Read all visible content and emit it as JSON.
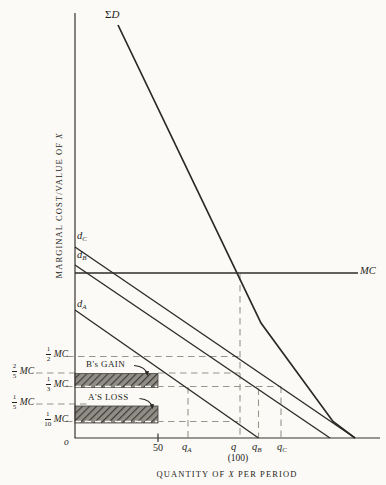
{
  "titles": {
    "y_pre": "MARGINAL COST/VALUE OF ",
    "y_x": "X",
    "x_pre": "QUANTITY OF ",
    "x_x": "X",
    "x_post": " PER PERIOD"
  },
  "axes": {
    "origin": "o"
  },
  "curves": {
    "sigma_d": {
      "sigma": "Σ",
      "name": "D"
    },
    "d_c": {
      "base": "d",
      "sub": "C"
    },
    "d_b": {
      "base": "d",
      "sub": "B"
    },
    "d_a": {
      "base": "d",
      "sub": "A"
    },
    "mc": {
      "label": "MC"
    }
  },
  "y_labels": [
    {
      "num": "1",
      "den": "2",
      "unit": "MC"
    },
    {
      "num": "2",
      "den": "5",
      "unit": "MC"
    },
    {
      "num": "1",
      "den": "3",
      "unit": "MC"
    },
    {
      "num": "1",
      "den": "5",
      "unit": "MC"
    },
    {
      "num": "1",
      "den": "10",
      "unit": "MC"
    }
  ],
  "x_labels": {
    "fifty": "50",
    "q_a": {
      "base": "q",
      "sub": "A"
    },
    "q": {
      "base": "q",
      "sub": ""
    },
    "q_paren": "(100)",
    "q_b": {
      "base": "q",
      "sub": "B"
    },
    "q_c": {
      "base": "q",
      "sub": "C"
    }
  },
  "annotations": {
    "b_gain": "B's GAIN",
    "a_loss": "A'S LOSS"
  },
  "colors": {
    "line": "#2e2c29",
    "dashed": "#98948e",
    "dashed_on_fill": "#f7f6f2",
    "hatch_dark": "#403d39",
    "hatch_light": "#918e88",
    "background": "#fbfaf6",
    "text": "#1f1d1a"
  },
  "chart_data": {
    "type": "line",
    "title": "",
    "xlabel": "QUANTITY OF X PER PERIOD",
    "ylabel": "MARGINAL COST/VALUE OF X",
    "axis_ranges": {
      "x": [
        0,
        185
      ],
      "y_in_MC_units": [
        0,
        2.6
      ]
    },
    "grid": false,
    "legend_position": "inline-labels",
    "series": [
      {
        "name": "ΣD (vertical sum of individual demands)",
        "points_x_units_y_MC": [
          [
            26,
            2.51
          ],
          [
            113,
            0.7
          ],
          [
            156,
            0.1
          ],
          [
            170,
            0
          ]
        ]
      },
      {
        "name": "d_C",
        "points_x_units_y_MC": [
          [
            0,
            1.16
          ],
          [
            170,
            0
          ]
        ]
      },
      {
        "name": "d_B",
        "points_x_units_y_MC": [
          [
            0,
            1.05
          ],
          [
            155,
            0
          ]
        ]
      },
      {
        "name": "d_A",
        "points_x_units_y_MC": [
          [
            0,
            0.77
          ],
          [
            111,
            0
          ]
        ]
      },
      {
        "name": "MC",
        "points_x_units_y_MC": [
          [
            0,
            1.0
          ],
          [
            171.5,
            1.0
          ]
        ]
      }
    ],
    "x_ticks": [
      {
        "label": "50",
        "x": 50
      },
      {
        "label": "q_A",
        "x": 68.5
      },
      {
        "label": "q (100)",
        "x": 100
      },
      {
        "label": "q_B",
        "x": 111.5
      },
      {
        "label": "q_C",
        "x": 125
      }
    ],
    "y_reference_levels": [
      {
        "label": "1/2 MC",
        "y": 0.5
      },
      {
        "label": "2/5 MC",
        "y": 0.4
      },
      {
        "label": "1/3 MC",
        "y": 0.3333
      },
      {
        "label": "1/5 MC",
        "y": 0.2
      },
      {
        "label": "1/10 MC",
        "y": 0.1
      }
    ],
    "shaded_regions": [
      {
        "label": "B's GAIN",
        "x": [
          0,
          50
        ],
        "y": [
          0.3333,
          0.4
        ]
      },
      {
        "label": "A'S LOSS",
        "x": [
          0,
          50
        ],
        "y": [
          0.1,
          0.2
        ]
      }
    ]
  },
  "geometry": {
    "rects": [
      {
        "name": "b-gain-region",
        "x": 75,
        "y": 373.5,
        "w": 83,
        "h": 14
      },
      {
        "name": "a-loss-region",
        "x": 75,
        "y": 406,
        "w": 83,
        "h": 17
      }
    ],
    "dashes": [
      {
        "name": "ref-line-half-mc",
        "x1": 67,
        "y1": 356.5,
        "x2": 240,
        "y2": 356.5,
        "cls": "dash"
      },
      {
        "name": "ref-line-two-fifths-mc-left",
        "x1": 36,
        "y1": 373,
        "x2": 75,
        "y2": 373,
        "cls": "dash"
      },
      {
        "name": "ref-line-two-fifths-mc-right",
        "x1": 158,
        "y1": 373,
        "x2": 240,
        "y2": 373,
        "cls": "dash"
      },
      {
        "name": "ref-line-third-mc-left",
        "x1": 66,
        "y1": 386.5,
        "x2": 75,
        "y2": 386.5,
        "cls": "dash"
      },
      {
        "name": "ref-line-third-mc-on-fill",
        "x1": 75,
        "y1": 386.5,
        "x2": 157,
        "y2": 386.5,
        "cls": "dashw"
      },
      {
        "name": "ref-line-third-mc-right",
        "x1": 157,
        "y1": 386.5,
        "x2": 281,
        "y2": 386.5,
        "cls": "dash"
      },
      {
        "name": "ref-line-fifth-mc",
        "x1": 36,
        "y1": 404,
        "x2": 88,
        "y2": 404,
        "cls": "dash"
      },
      {
        "name": "ref-line-tenth-mc-left",
        "x1": 66,
        "y1": 421.5,
        "x2": 75,
        "y2": 421.5,
        "cls": "dash"
      },
      {
        "name": "ref-line-tenth-mc-on-fill",
        "x1": 75,
        "y1": 421.5,
        "x2": 157,
        "y2": 421.5,
        "cls": "dashw"
      },
      {
        "name": "ref-line-tenth-mc-right",
        "x1": 157,
        "y1": 421.5,
        "x2": 238,
        "y2": 421.5,
        "cls": "dash"
      },
      {
        "name": "vline-q",
        "x1": 240,
        "y1": 274,
        "x2": 240,
        "y2": 438,
        "cls": "dash"
      },
      {
        "name": "vline-q-a",
        "x1": 188,
        "y1": 387,
        "x2": 188,
        "y2": 438,
        "cls": "dash"
      },
      {
        "name": "vline-q-b",
        "x1": 258.5,
        "y1": 388.5,
        "x2": 258.5,
        "y2": 438,
        "cls": "dash"
      },
      {
        "name": "vline-q-c",
        "x1": 281,
        "y1": 386.5,
        "x2": 281,
        "y2": 438,
        "cls": "dash"
      }
    ],
    "solids": [
      {
        "name": "y-axis",
        "x1": 75,
        "y1": 13,
        "x2": 75,
        "y2": 438,
        "cls": "axisln"
      },
      {
        "name": "x-axis",
        "x1": 74.5,
        "y1": 438,
        "x2": 380,
        "y2": 438,
        "cls": "axisln"
      },
      {
        "name": "tick-50",
        "x1": 158,
        "y1": 433.5,
        "x2": 158,
        "y2": 442,
        "cls": "axisln"
      },
      {
        "name": "mc-curve",
        "x1": 75,
        "y1": 273,
        "x2": 358,
        "y2": 273,
        "cls": "solid"
      },
      {
        "name": "d-c-curve",
        "x1": 75,
        "y1": 247,
        "x2": 355,
        "y2": 438,
        "cls": "solid"
      },
      {
        "name": "d-b-curve",
        "x1": 75,
        "y1": 265,
        "x2": 330,
        "y2": 438,
        "cls": "solid"
      },
      {
        "name": "d-a-curve",
        "x1": 75,
        "y1": 310,
        "x2": 258.5,
        "y2": 438,
        "cls": "solid"
      }
    ],
    "polylines": [
      {
        "name": "sigma-d-curve",
        "points": "118,25 261,323 333,421.5 355,438",
        "cls": "sigma"
      }
    ],
    "arrows": [
      {
        "name": "b-gain-arrow",
        "d": "M134,365.5 Q146,366.5 147.5,375"
      },
      {
        "name": "a-loss-arrow",
        "d": "M139.5,398.5 Q151,399.5 152.5,408"
      }
    ]
  }
}
